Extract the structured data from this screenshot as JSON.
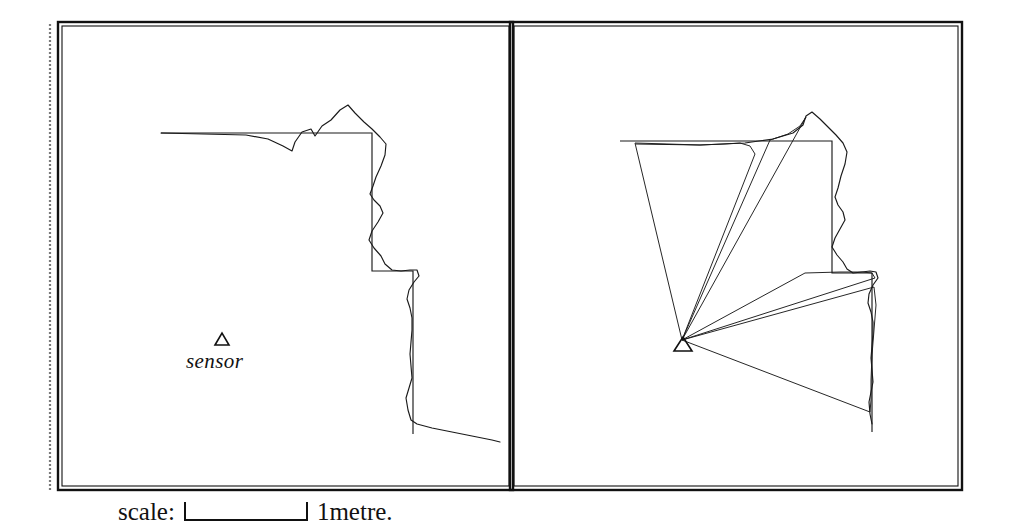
{
  "figure": {
    "kind": "two-panel-sensor-scan-figure",
    "panels": [
      {
        "id": "left",
        "name": "scan-overlay-panel"
      },
      {
        "id": "right",
        "name": "sector-fan-panel"
      }
    ]
  },
  "annotations": {
    "sensor_marker_glyph": "triangle-up",
    "sensor_label": "sensor"
  },
  "scale": {
    "label": "scale:",
    "unit": "1metre.",
    "bar_length_px": 124
  },
  "colors": {
    "ink": "#1a1a1a",
    "frame": "#111111",
    "background": "#ffffff",
    "speckle": "#7a7a7a"
  },
  "chart_data": {
    "type": "line",
    "title": "",
    "xlabel": "",
    "ylabel": "",
    "grid": false,
    "legend": null,
    "coordinate_space": "pixels (1021x526 image frame)",
    "axis_ranges": {
      "x": [
        0,
        1021
      ],
      "y": [
        0,
        526
      ]
    },
    "frames": {
      "outer_left": {
        "x": 58,
        "y": 22,
        "w": 455,
        "h": 468
      },
      "outer_right": {
        "x": 510,
        "y": 22,
        "w": 452,
        "h": 468
      },
      "inner_inset_px": 4,
      "left_edge_speckle": {
        "x": 50,
        "y1": 24,
        "y2": 492
      }
    },
    "series": [
      {
        "name": "left-panel-ground-truth-map",
        "panel": "left",
        "style": "straight-polyline",
        "points": [
          [
            161,
            133
          ],
          [
            372,
            133
          ],
          [
            372,
            271
          ],
          [
            413,
            271
          ],
          [
            413,
            434
          ]
        ]
      },
      {
        "name": "left-panel-sensor-scan",
        "panel": "left",
        "style": "jagged-polyline",
        "points": [
          [
            161,
            133
          ],
          [
            203,
            134
          ],
          [
            246,
            135
          ],
          [
            268,
            139
          ],
          [
            283,
            146
          ],
          [
            292,
            151
          ],
          [
            295,
            142
          ],
          [
            302,
            132
          ],
          [
            311,
            129
          ],
          [
            315,
            136
          ],
          [
            322,
            126
          ],
          [
            331,
            120
          ],
          [
            340,
            110
          ],
          [
            348,
            105
          ],
          [
            355,
            113
          ],
          [
            364,
            122
          ],
          [
            372,
            129
          ],
          [
            380,
            137
          ],
          [
            386,
            144
          ],
          [
            385,
            155
          ],
          [
            381,
            166
          ],
          [
            376,
            177
          ],
          [
            373,
            186
          ],
          [
            370,
            194
          ],
          [
            374,
            200
          ],
          [
            380,
            206
          ],
          [
            383,
            213
          ],
          [
            378,
            222
          ],
          [
            372,
            231
          ],
          [
            369,
            240
          ],
          [
            374,
            248
          ],
          [
            381,
            256
          ],
          [
            385,
            264
          ],
          [
            392,
            270
          ],
          [
            401,
            271
          ],
          [
            410,
            270
          ],
          [
            417,
            270
          ],
          [
            419,
            276
          ],
          [
            414,
            282
          ],
          [
            409,
            290
          ],
          [
            407,
            299
          ],
          [
            410,
            308
          ],
          [
            412,
            318
          ],
          [
            412,
            330
          ],
          [
            411,
            342
          ],
          [
            410,
            354
          ],
          [
            411,
            366
          ],
          [
            412,
            378
          ],
          [
            409,
            388
          ],
          [
            406,
            398
          ],
          [
            408,
            410
          ],
          [
            411,
            420
          ],
          [
            417,
            424
          ],
          [
            432,
            428
          ],
          [
            452,
            432
          ],
          [
            472,
            436
          ],
          [
            492,
            440
          ],
          [
            500,
            442
          ]
        ]
      },
      {
        "name": "right-panel-ground-truth-map",
        "panel": "right",
        "style": "straight-polyline",
        "points": [
          [
            620,
            141
          ],
          [
            832,
            141
          ],
          [
            832,
            273
          ],
          [
            872,
            273
          ],
          [
            872,
            432
          ]
        ]
      },
      {
        "name": "right-panel-sensor-scan",
        "panel": "right",
        "style": "jagged-polyline",
        "points": [
          [
            636,
            144
          ],
          [
            700,
            145
          ],
          [
            745,
            143
          ],
          [
            773,
            139
          ],
          [
            793,
            133
          ],
          [
            803,
            125
          ],
          [
            806,
            116
          ],
          [
            812,
            112
          ],
          [
            820,
            119
          ],
          [
            828,
            127
          ],
          [
            836,
            135
          ],
          [
            843,
            143
          ],
          [
            847,
            152
          ],
          [
            845,
            164
          ],
          [
            841,
            176
          ],
          [
            838,
            188
          ],
          [
            835,
            197
          ],
          [
            838,
            205
          ],
          [
            843,
            212
          ],
          [
            845,
            220
          ],
          [
            840,
            229
          ],
          [
            835,
            238
          ],
          [
            832,
            247
          ],
          [
            837,
            255
          ],
          [
            843,
            262
          ],
          [
            847,
            269
          ],
          [
            853,
            273
          ],
          [
            862,
            272
          ],
          [
            870,
            271
          ],
          [
            876,
            272
          ],
          [
            878,
            278
          ],
          [
            873,
            285
          ],
          [
            869,
            294
          ],
          [
            868,
            303
          ],
          [
            871,
            312
          ],
          [
            873,
            322
          ],
          [
            873,
            334
          ],
          [
            872,
            346
          ],
          [
            871,
            358
          ],
          [
            872,
            370
          ],
          [
            873,
            382
          ],
          [
            871,
            392
          ],
          [
            869,
            402
          ],
          [
            870,
            414
          ],
          [
            872,
            424
          ]
        ]
      }
    ],
    "sector_fans": {
      "panel": "right",
      "apex": [
        682,
        340
      ],
      "sectors": [
        {
          "id": 1,
          "start_vertex": [
            635,
            143
          ],
          "arc": [
            [
              635,
              143
            ],
            [
              668,
              144
            ],
            [
              700,
              145
            ],
            [
              724,
              144
            ],
            [
              740,
              143
            ],
            [
              750,
              146
            ],
            [
              755,
              154
            ]
          ],
          "end_vertex": [
            755,
            154
          ]
        },
        {
          "id": 2,
          "start_vertex": [
            770,
            140
          ],
          "arc": [
            [
              770,
              140
            ],
            [
              788,
              134
            ],
            [
              800,
              126
            ],
            [
              806,
              117
            ]
          ],
          "end_vertex": [
            806,
            117
          ]
        },
        {
          "id": 3,
          "start_vertex": [
            805,
            273
          ],
          "arc": [
            [
              805,
              273
            ],
            [
              840,
              272
            ],
            [
              862,
              272
            ],
            [
              872,
              273
            ],
            [
              875,
              278
            ]
          ],
          "end_vertex": [
            875,
            278
          ]
        },
        {
          "id": 4,
          "start_vertex": [
            874,
            287
          ],
          "arc": [
            [
              874,
              287
            ],
            [
              876,
              305
            ],
            [
              874,
              330
            ],
            [
              872,
              355
            ],
            [
              871,
              380
            ],
            [
              871,
              400
            ],
            [
              870,
              412
            ]
          ],
          "end_vertex": [
            870,
            412
          ]
        }
      ]
    },
    "sensor_positions": [
      {
        "panel": "left",
        "x": 222,
        "y": 339,
        "label": "sensor"
      },
      {
        "panel": "right",
        "x": 682,
        "y": 340,
        "label": null
      }
    ]
  }
}
